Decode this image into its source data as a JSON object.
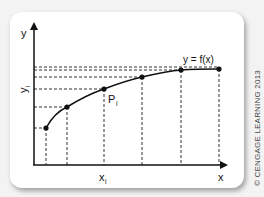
{
  "diagram": {
    "curve_label": "y = f(x)",
    "point_label": "P",
    "point_label_sub": "i",
    "y_axis_label": "y",
    "x_axis_label": "x",
    "y_tick_label": "y",
    "y_tick_label_sub": "i",
    "x_tick_label": "x",
    "x_tick_label_sub": "i",
    "copyright": "© CENGAGE LEARNING 2013",
    "colors": {
      "curve": "#111111",
      "dashed": "#333333",
      "card_bg": "#ffffff",
      "page_bg": "#f3f3f3"
    },
    "points": [
      {
        "x": 46,
        "y": 128
      },
      {
        "x": 67,
        "y": 107
      },
      {
        "x": 104,
        "y": 89
      },
      {
        "x": 142,
        "y": 77
      },
      {
        "x": 181,
        "y": 70
      },
      {
        "x": 219,
        "y": 69
      }
    ]
  }
}
